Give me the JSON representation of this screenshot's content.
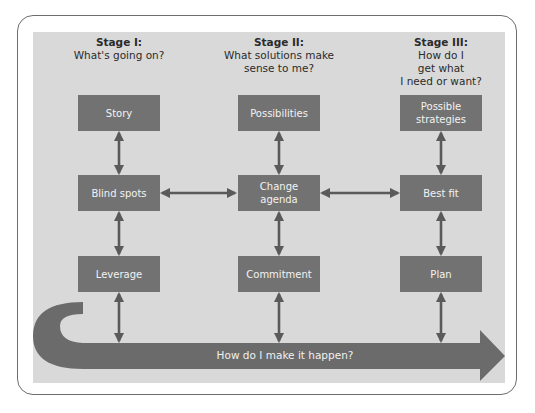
{
  "stages": [
    {
      "title": "Stage I:",
      "question": "What's going on?"
    },
    {
      "title": "Stage II:",
      "question_lines": [
        "What solutions make",
        "sense to me?"
      ]
    },
    {
      "title": "Stage III:",
      "question_lines": [
        "How do I",
        "get what",
        "I need or want?"
      ]
    }
  ],
  "boxes": {
    "col1": [
      "Story",
      "Blind spots",
      "Leverage"
    ],
    "col2": [
      "Possibilities",
      "Change agenda",
      "Commitment"
    ],
    "col3": [
      "Possible strategies",
      "Best fit",
      "Plan"
    ]
  },
  "box_lines": {
    "change_agenda": [
      "Change",
      "agenda"
    ],
    "possible_strategies": [
      "Possible",
      "strategies"
    ]
  },
  "bottom_arrow": {
    "label": "How do I make it happen?"
  },
  "colors": {
    "panel": "#d9d9d9",
    "box": "#727272",
    "arrow": "#6b6b6b",
    "connector": "#5a5a5a",
    "border": "#6d6d6d"
  }
}
